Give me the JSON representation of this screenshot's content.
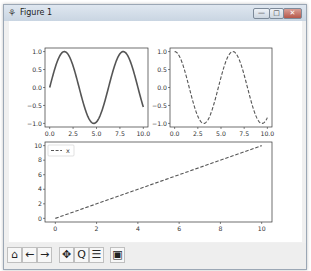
{
  "window": {
    "title": "Figure 1",
    "icon": "figure-icon",
    "controls": {
      "minimize": "—",
      "maximize": "□",
      "close": "✕"
    }
  },
  "toolbar": {
    "buttons": [
      {
        "name": "home",
        "glyph": "⌂"
      },
      {
        "name": "back",
        "glyph": "←"
      },
      {
        "name": "forward",
        "glyph": "→"
      },
      {
        "name": "pan",
        "glyph": "✥"
      },
      {
        "name": "zoom",
        "glyph": "Q"
      },
      {
        "name": "configure-subplots",
        "glyph": "☰"
      },
      {
        "name": "save",
        "glyph": "▣"
      }
    ]
  },
  "chart_data": [
    {
      "type": "line",
      "title": "",
      "series": [
        {
          "name": "sin(x)",
          "style": "solid",
          "function": "sin(x)",
          "x_range": [
            0,
            10
          ]
        }
      ],
      "xticks": [
        "0.0",
        "2.5",
        "5.0",
        "7.5",
        "10.0"
      ],
      "yticks": [
        "−1.0",
        "−0.5",
        "0.0",
        "0.5",
        "1.0"
      ],
      "xlim": [
        0,
        10
      ],
      "ylim": [
        -1,
        1
      ]
    },
    {
      "type": "line",
      "title": "",
      "series": [
        {
          "name": "cos(x)",
          "style": "dashed",
          "function": "cos(x)",
          "x_range": [
            0,
            10
          ]
        }
      ],
      "xticks": [
        "0.0",
        "2.5",
        "5.0",
        "7.5",
        "10.0"
      ],
      "yticks": [
        "−1.0",
        "−0.5",
        "0.0",
        "0.5",
        "1.0"
      ],
      "xlim": [
        0,
        10
      ],
      "ylim": [
        -1,
        1
      ]
    },
    {
      "type": "line",
      "title": "",
      "series": [
        {
          "name": "x",
          "style": "dashed",
          "x": [
            0,
            10
          ],
          "y": [
            0,
            10
          ]
        }
      ],
      "xticks": [
        "0",
        "2",
        "4",
        "6",
        "8",
        "10"
      ],
      "yticks": [
        "0",
        "2",
        "4",
        "6",
        "8",
        "10"
      ],
      "xlim": [
        0,
        10
      ],
      "ylim": [
        0,
        10
      ],
      "legend": {
        "entries": [
          "x"
        ],
        "position": "upper left"
      }
    }
  ]
}
